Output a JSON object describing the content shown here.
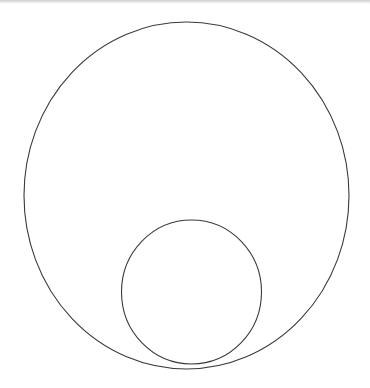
{
  "canvas": {
    "width": 370,
    "height": 388,
    "background": "#ffffff",
    "stroke_color": "#3a3a3a",
    "stroke_width": 1.1
  },
  "shapes": {
    "outer_circle": {
      "cx": 186.5,
      "cy": 195.5,
      "rx": 162.5,
      "ry": 173.5
    },
    "inner_circle": {
      "cx": 191.5,
      "cy": 292,
      "rx": 70,
      "ry": 72
    }
  }
}
